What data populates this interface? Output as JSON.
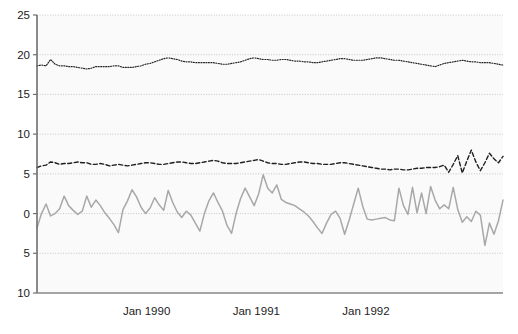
{
  "chart_data": {
    "type": "line",
    "title": "",
    "xlabel": "",
    "ylabel": "",
    "ylim": [
      -10,
      25
    ],
    "yticks": [
      25,
      20,
      15,
      10,
      5,
      0,
      5,
      10
    ],
    "ytick_values": [
      25,
      20,
      15,
      10,
      5,
      0,
      -5,
      -10
    ],
    "grid": true,
    "grid_axis": "y",
    "legend_position": "none",
    "xlim_years": [
      1989.0,
      1993.25
    ],
    "xticks": [
      1990.0,
      1991.0,
      1992.0
    ],
    "xtick_labels": [
      "Jan 1990",
      "Jan 1991",
      "Jan 1992"
    ],
    "x_unit": "month",
    "series": [
      {
        "name": "series-dotted-top",
        "style": "dotted",
        "color": "#262626",
        "width": 1.2,
        "values": [
          18.6,
          18.7,
          18.6,
          19.4,
          18.8,
          18.6,
          18.6,
          18.5,
          18.5,
          18.4,
          18.3,
          18.2,
          18.3,
          18.5,
          18.5,
          18.5,
          18.5,
          18.6,
          18.6,
          18.4,
          18.4,
          18.4,
          18.5,
          18.6,
          18.8,
          18.9,
          19.1,
          19.3,
          19.5,
          19.6,
          19.5,
          19.4,
          19.2,
          19.1,
          19.1,
          19.0,
          19.0,
          19.0,
          19.0,
          19.0,
          18.9,
          18.8,
          18.8,
          18.9,
          19.0,
          19.1,
          19.3,
          19.5,
          19.6,
          19.5,
          19.4,
          19.4,
          19.3,
          19.3,
          19.4,
          19.4,
          19.3,
          19.2,
          19.2,
          19.1,
          19.1,
          19.0,
          19.0,
          19.1,
          19.2,
          19.3,
          19.4,
          19.5,
          19.5,
          19.4,
          19.3,
          19.3,
          19.3,
          19.4,
          19.5,
          19.6,
          19.6,
          19.5,
          19.4,
          19.3,
          19.3,
          19.2,
          19.1,
          19.0,
          18.9,
          18.8,
          18.7,
          18.6,
          18.5,
          18.7,
          18.9,
          19.0,
          19.1,
          19.2,
          19.3,
          19.2,
          19.1,
          19.1,
          19.0,
          19.0,
          19.0,
          18.9,
          18.8,
          18.7
        ]
      },
      {
        "name": "series-dashed-middle",
        "style": "dashed",
        "color": "#1f1f1f",
        "width": 1.4,
        "values": [
          5.8,
          6.0,
          6.1,
          6.5,
          6.4,
          6.2,
          6.3,
          6.3,
          6.4,
          6.5,
          6.4,
          6.4,
          6.2,
          6.2,
          6.3,
          6.2,
          6.0,
          6.1,
          6.2,
          6.1,
          6.0,
          6.1,
          6.2,
          6.3,
          6.4,
          6.4,
          6.3,
          6.2,
          6.2,
          6.3,
          6.4,
          6.5,
          6.5,
          6.4,
          6.3,
          6.3,
          6.4,
          6.5,
          6.6,
          6.7,
          6.6,
          6.4,
          6.3,
          6.3,
          6.3,
          6.4,
          6.5,
          6.6,
          6.7,
          6.8,
          6.6,
          6.4,
          6.3,
          6.3,
          6.2,
          6.2,
          6.3,
          6.4,
          6.5,
          6.5,
          6.4,
          6.3,
          6.3,
          6.2,
          6.2,
          6.2,
          6.3,
          6.4,
          6.4,
          6.3,
          6.2,
          6.1,
          6.0,
          5.9,
          5.8,
          5.7,
          5.6,
          5.6,
          5.5,
          5.6,
          5.6,
          5.5,
          5.5,
          5.6,
          5.7,
          5.7,
          5.8,
          5.8,
          5.8,
          5.9,
          6.1,
          5.2,
          6.2,
          7.3,
          5.1,
          6.6,
          8.0,
          6.5,
          5.4,
          6.4,
          7.6,
          6.9,
          6.4,
          7.2
        ]
      },
      {
        "name": "series-solid-gray-bottom",
        "style": "solid",
        "color": "#a8a8a8",
        "width": 1.5,
        "values": [
          -1.8,
          0.0,
          1.2,
          -0.3,
          0.0,
          0.6,
          2.2,
          1.0,
          0.4,
          -0.1,
          0.3,
          2.2,
          0.8,
          1.7,
          1.0,
          0.1,
          -0.6,
          -1.4,
          -2.4,
          0.5,
          1.6,
          3.0,
          2.1,
          0.8,
          0.0,
          0.7,
          2.0,
          1.1,
          0.4,
          2.9,
          1.4,
          0.2,
          -0.5,
          0.3,
          -0.2,
          -1.2,
          -2.2,
          0.0,
          1.6,
          2.6,
          1.4,
          0.3,
          -1.5,
          -2.5,
          0.0,
          1.9,
          3.2,
          2.1,
          1.0,
          2.5,
          4.9,
          3.2,
          2.6,
          3.6,
          1.8,
          1.4,
          1.2,
          1.0,
          0.6,
          0.2,
          -0.3,
          -1.0,
          -1.8,
          -2.5,
          -1.2,
          -0.1,
          0.3,
          -0.6,
          -2.6,
          -0.8,
          1.2,
          3.2,
          0.9,
          -0.7,
          -0.8,
          -0.7,
          -0.6,
          -0.5,
          -0.8,
          -0.9,
          3.2,
          1.0,
          -0.1,
          3.3,
          0.1,
          2.6,
          0.0,
          3.4,
          1.7,
          0.6,
          1.1,
          0.6,
          3.3,
          0.5,
          -1.1,
          -0.4,
          -1.0,
          0.3,
          -0.2,
          -4.0,
          -1.2,
          -2.6,
          -0.9,
          1.7
        ]
      }
    ]
  },
  "figure": {
    "background": "#ffffff",
    "plot_background": "#fafafa",
    "grid_color": "#b9b9b9",
    "axis_color": "#6e6e6e",
    "tick_label_color": "#1c1c1c"
  },
  "footer": {
    "clipped_text": ""
  }
}
